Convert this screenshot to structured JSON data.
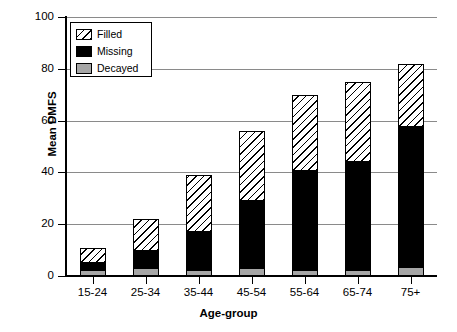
{
  "chart_data": {
    "type": "bar",
    "title": "",
    "subtitle": "",
    "xlabel": "Age-group",
    "ylabel": "Mean DMFS",
    "ylim": [
      0,
      100
    ],
    "yticks": [
      0,
      20,
      40,
      60,
      80,
      100
    ],
    "grid": true,
    "stacked": true,
    "legend_position": "top-left",
    "categories": [
      "15-24",
      "25-34",
      "35-44",
      "45-54",
      "55-64",
      "65-74",
      "75+"
    ],
    "series": [
      {
        "name": "Decayed",
        "color": "#a6a6a6",
        "pattern": "solid-gray",
        "values": [
          2.5,
          3.0,
          2.5,
          3.0,
          2.5,
          2.5,
          3.5
        ]
      },
      {
        "name": "Missing",
        "color": "#000000",
        "pattern": "solid-black",
        "values": [
          2.5,
          6.5,
          14.5,
          26.0,
          38.0,
          41.5,
          54.0
        ]
      },
      {
        "name": "Filled",
        "color": "#ffffff",
        "pattern": "diagonal-hatch",
        "values": [
          6.0,
          12.5,
          22.0,
          27.0,
          29.5,
          31.0,
          24.5
        ]
      }
    ],
    "totals": [
      11,
      22,
      39,
      56,
      70,
      75,
      82
    ],
    "segment_tops": {
      "Decayed": [
        2.5,
        3.0,
        2.5,
        3.0,
        2.5,
        2.5,
        3.5
      ],
      "Missing": [
        5.0,
        9.5,
        17.0,
        29.0,
        40.5,
        44.0,
        57.5
      ],
      "Filled": [
        11.0,
        22.0,
        39.0,
        56.0,
        70.0,
        75.0,
        82.0
      ]
    }
  },
  "legend": {
    "items": [
      {
        "label": "Filled",
        "swatch": "hatch-swatch"
      },
      {
        "label": "Missing",
        "swatch": "black-swatch"
      },
      {
        "label": "Decayed",
        "swatch": "gray-swatch"
      }
    ]
  }
}
